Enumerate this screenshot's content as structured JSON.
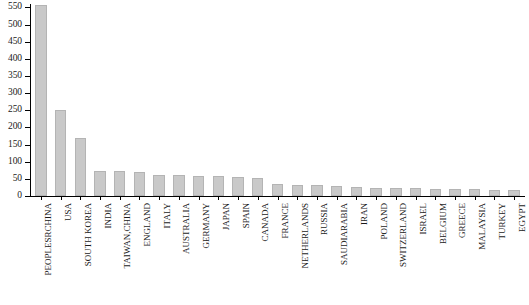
{
  "chart_data": {
    "type": "bar",
    "title": "",
    "subtitle": "",
    "xlabel": "",
    "ylabel": "",
    "ylim": [
      0,
      560
    ],
    "ytick_step": 50,
    "yticks": [
      0,
      50,
      100,
      150,
      200,
      250,
      300,
      350,
      400,
      450,
      500,
      550
    ],
    "grid": false,
    "legend": null,
    "bar_color": "#c9c9c9",
    "bar_edge_color": "#b4b4b4",
    "axis_color": "#000000",
    "categories": [
      "PEOPLESRCHINA",
      "USA",
      "SOUTH KOREA",
      "INDIA",
      "TAIWAN,CHINA",
      "ENGLAND",
      "ITALY",
      "AUSTRALIA",
      "GERMANY",
      "JAPAN",
      "SPAIN",
      "CANADA",
      "FRANCE",
      "NETHERLANDS",
      "RUSSIA",
      "SAUDIARABIA",
      "IRAN",
      "POLAND",
      "SWITZERLAND",
      "ISRAEL",
      "BELGIUM",
      "GREECE",
      "MALAYSIA",
      "TURKEY",
      "EGYPT"
    ],
    "values": [
      558,
      252,
      170,
      74,
      73,
      70,
      62,
      60,
      58,
      57,
      55,
      53,
      34,
      32,
      31,
      30,
      25,
      24,
      23,
      22,
      21,
      20,
      19,
      18,
      17
    ]
  },
  "caption": {
    "text": ""
  }
}
